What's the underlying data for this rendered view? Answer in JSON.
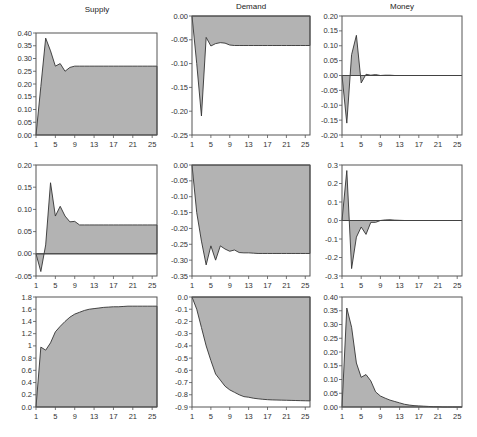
{
  "column_titles": [
    "Supply",
    "Demand",
    "Money"
  ],
  "chart_data": [
    {
      "type": "area",
      "panel": "row1-col1",
      "title": "Supply",
      "x": [
        1,
        2,
        3,
        4,
        5,
        6,
        7,
        8,
        9,
        10,
        11,
        12,
        13,
        14,
        15,
        16,
        17,
        18,
        19,
        20,
        21,
        22,
        23,
        24,
        25,
        26
      ],
      "values": [
        0.0,
        0.19,
        0.38,
        0.33,
        0.27,
        0.28,
        0.25,
        0.265,
        0.27,
        0.27,
        0.27,
        0.27,
        0.27,
        0.27,
        0.27,
        0.27,
        0.27,
        0.27,
        0.27,
        0.27,
        0.27,
        0.27,
        0.27,
        0.27,
        0.27,
        0.27
      ],
      "ylim": [
        0.0,
        0.4
      ],
      "yticks": [
        0.0,
        0.05,
        0.1,
        0.15,
        0.2,
        0.25,
        0.3,
        0.35,
        0.4
      ],
      "ytick_labels": [
        "0.00",
        "0.05",
        "0.10",
        "0.15",
        "0.20",
        "0.25",
        "0.30",
        "0.35",
        "0.40"
      ],
      "xticks": [
        1,
        5,
        9,
        13,
        17,
        21,
        25
      ],
      "xtick_labels": [
        "1",
        "5",
        "9",
        "13",
        "17",
        "21",
        "25"
      ]
    },
    {
      "type": "area",
      "panel": "row1-col2",
      "title": "Demand",
      "x": [
        1,
        2,
        3,
        4,
        5,
        6,
        7,
        8,
        9,
        10,
        11,
        12,
        13,
        14,
        15,
        16,
        17,
        18,
        19,
        20,
        21,
        22,
        23,
        24,
        25,
        26
      ],
      "values": [
        0.0,
        -0.1,
        -0.21,
        -0.045,
        -0.063,
        -0.058,
        -0.056,
        -0.057,
        -0.061,
        -0.062,
        -0.062,
        -0.062,
        -0.062,
        -0.062,
        -0.062,
        -0.062,
        -0.062,
        -0.062,
        -0.062,
        -0.062,
        -0.062,
        -0.062,
        -0.062,
        -0.062,
        -0.062,
        -0.062
      ],
      "ylim": [
        -0.25,
        0.0
      ],
      "yticks": [
        -0.25,
        -0.2,
        -0.15,
        -0.1,
        -0.05,
        0.0
      ],
      "ytick_labels": [
        "-0.25",
        "-0.20",
        "-0.15",
        "-0.10",
        "-0.05",
        "0.00"
      ],
      "xticks": [
        1,
        5,
        9,
        13,
        17,
        21,
        25
      ],
      "xtick_labels": [
        "1",
        "5",
        "9",
        "13",
        "17",
        "21",
        "25"
      ]
    },
    {
      "type": "area",
      "panel": "row1-col3",
      "title": "Money",
      "x": [
        1,
        2,
        3,
        4,
        5,
        6,
        7,
        8,
        9,
        10,
        11,
        12,
        13,
        14,
        15,
        16,
        17,
        18,
        19,
        20,
        21,
        22,
        23,
        24,
        25,
        26
      ],
      "values": [
        0.0,
        -0.16,
        0.07,
        0.135,
        -0.025,
        0.004,
        0.001,
        0.003,
        0.0,
        0.001,
        0.001,
        0.0,
        0.0,
        0.0,
        0.0,
        0.0,
        0.0,
        0.0,
        0.0,
        0.0,
        0.0,
        0.0,
        0.0,
        0.0,
        0.0,
        0.0
      ],
      "ylim": [
        -0.2,
        0.2
      ],
      "yticks": [
        -0.2,
        -0.15,
        -0.1,
        -0.05,
        0.0,
        0.05,
        0.1,
        0.15,
        0.2
      ],
      "ytick_labels": [
        "-0.20",
        "-0.15",
        "-0.10",
        "-0.05",
        "0.00",
        "0.05",
        "0.10",
        "0.15",
        "0.20"
      ],
      "xticks": [
        1,
        5,
        9,
        13,
        17,
        21,
        25
      ],
      "xtick_labels": [
        "1",
        "5",
        "9",
        "13",
        "17",
        "21",
        "25"
      ]
    },
    {
      "type": "area",
      "panel": "row2-col1",
      "title": "",
      "x": [
        1,
        2,
        3,
        4,
        5,
        6,
        7,
        8,
        9,
        10,
        11,
        12,
        13,
        14,
        15,
        16,
        17,
        18,
        19,
        20,
        21,
        22,
        23,
        24,
        25,
        26
      ],
      "values": [
        0.0,
        -0.04,
        0.02,
        0.16,
        0.085,
        0.107,
        0.085,
        0.072,
        0.073,
        0.065,
        0.065,
        0.065,
        0.065,
        0.065,
        0.065,
        0.065,
        0.065,
        0.065,
        0.065,
        0.065,
        0.065,
        0.065,
        0.065,
        0.065,
        0.065,
        0.065
      ],
      "ylim": [
        -0.05,
        0.2
      ],
      "yticks": [
        -0.05,
        0.0,
        0.05,
        0.1,
        0.15,
        0.2
      ],
      "ytick_labels": [
        "-0.05",
        "0.00",
        "0.05",
        "0.10",
        "0.15",
        "0.20"
      ],
      "xticks": [
        1,
        5,
        9,
        13,
        17,
        21,
        25
      ],
      "xtick_labels": [
        "1",
        "5",
        "9",
        "13",
        "17",
        "21",
        "25"
      ]
    },
    {
      "type": "area",
      "panel": "row2-col2",
      "title": "",
      "x": [
        1,
        2,
        3,
        4,
        5,
        6,
        7,
        8,
        9,
        10,
        11,
        12,
        13,
        14,
        15,
        16,
        17,
        18,
        19,
        20,
        21,
        22,
        23,
        24,
        25,
        26
      ],
      "values": [
        0.0,
        -0.15,
        -0.24,
        -0.315,
        -0.255,
        -0.3,
        -0.255,
        -0.265,
        -0.272,
        -0.268,
        -0.276,
        -0.277,
        -0.277,
        -0.278,
        -0.279,
        -0.279,
        -0.279,
        -0.279,
        -0.279,
        -0.279,
        -0.279,
        -0.279,
        -0.279,
        -0.279,
        -0.279,
        -0.279
      ],
      "ylim": [
        -0.35,
        0.0
      ],
      "yticks": [
        -0.35,
        -0.3,
        -0.25,
        -0.2,
        -0.15,
        -0.1,
        -0.05,
        0.0
      ],
      "ytick_labels": [
        "-0.35",
        "-0.30",
        "-0.25",
        "-0.20",
        "-0.15",
        "-0.10",
        "-0.05",
        "0.00"
      ],
      "xticks": [
        1,
        5,
        9,
        13,
        17,
        21,
        25
      ],
      "xtick_labels": [
        "1",
        "5",
        "9",
        "13",
        "17",
        "21",
        "25"
      ]
    },
    {
      "type": "area",
      "panel": "row2-col3",
      "title": "",
      "x": [
        1,
        2,
        3,
        4,
        5,
        6,
        7,
        8,
        9,
        10,
        11,
        12,
        13,
        14,
        15,
        16,
        17,
        18,
        19,
        20,
        21,
        22,
        23,
        24,
        25,
        26
      ],
      "values": [
        0.0,
        0.27,
        -0.26,
        -0.09,
        -0.035,
        -0.075,
        -0.01,
        -0.01,
        0.0,
        0.003,
        0.004,
        0.002,
        0.001,
        0.0,
        0.0,
        0.0,
        0.0,
        0.0,
        0.0,
        0.0,
        0.0,
        0.0,
        0.0,
        0.0,
        0.0,
        0.0
      ],
      "ylim": [
        -0.3,
        0.3
      ],
      "yticks": [
        -0.3,
        -0.2,
        -0.1,
        0.0,
        0.1,
        0.2,
        0.3
      ],
      "ytick_labels": [
        "-0.3",
        "-0.2",
        "-0.1",
        "0.0",
        "0.1",
        "0.2",
        "0.3"
      ],
      "xticks": [
        1,
        5,
        9,
        13,
        17,
        21,
        25
      ],
      "xtick_labels": [
        "1",
        "5",
        "9",
        "13",
        "17",
        "21",
        "25"
      ]
    },
    {
      "type": "area",
      "panel": "row3-col1",
      "title": "",
      "x": [
        1,
        2,
        3,
        4,
        5,
        6,
        7,
        8,
        9,
        10,
        11,
        12,
        13,
        14,
        15,
        16,
        17,
        18,
        19,
        20,
        21,
        22,
        23,
        24,
        25,
        26
      ],
      "values": [
        0.0,
        0.98,
        0.93,
        1.05,
        1.23,
        1.32,
        1.4,
        1.47,
        1.52,
        1.55,
        1.58,
        1.6,
        1.61,
        1.62,
        1.63,
        1.635,
        1.64,
        1.64,
        1.645,
        1.65,
        1.65,
        1.65,
        1.65,
        1.65,
        1.65,
        1.65
      ],
      "ylim": [
        0.0,
        1.8
      ],
      "yticks": [
        0.0,
        0.2,
        0.4,
        0.6,
        0.8,
        1.0,
        1.2,
        1.4,
        1.6,
        1.8
      ],
      "ytick_labels": [
        "0.0",
        "0.2",
        "0.4",
        "0.6",
        "0.8",
        "1",
        "1.2",
        "1.4",
        "1.6",
        "1.8"
      ],
      "xticks": [
        1,
        5,
        9,
        13,
        17,
        21,
        25
      ],
      "xtick_labels": [
        "1",
        "5",
        "9",
        "13",
        "17",
        "21",
        "25"
      ]
    },
    {
      "type": "area",
      "panel": "row3-col2",
      "title": "",
      "x": [
        1,
        2,
        3,
        4,
        5,
        6,
        7,
        8,
        9,
        10,
        11,
        12,
        13,
        14,
        15,
        16,
        17,
        18,
        19,
        20,
        21,
        22,
        23,
        24,
        25,
        26
      ],
      "values": [
        0.0,
        -0.1,
        -0.25,
        -0.4,
        -0.52,
        -0.63,
        -0.68,
        -0.73,
        -0.76,
        -0.78,
        -0.8,
        -0.815,
        -0.82,
        -0.828,
        -0.833,
        -0.837,
        -0.84,
        -0.842,
        -0.843,
        -0.844,
        -0.845,
        -0.846,
        -0.847,
        -0.848,
        -0.849,
        -0.85
      ],
      "ylim": [
        -0.9,
        0.0
      ],
      "yticks": [
        -0.9,
        -0.8,
        -0.7,
        -0.6,
        -0.5,
        -0.4,
        -0.3,
        -0.2,
        -0.1,
        0.0
      ],
      "ytick_labels": [
        "-0.9",
        "-0.8",
        "-0.7",
        "-0.6",
        "-0.5",
        "-0.4",
        "-0.3",
        "-0.2",
        "-0.1",
        "0.0"
      ],
      "xticks": [
        1,
        5,
        9,
        13,
        17,
        21,
        25
      ],
      "xtick_labels": [
        "1",
        "5",
        "9",
        "13",
        "17",
        "21",
        "25"
      ]
    },
    {
      "type": "area",
      "panel": "row3-col3",
      "title": "",
      "x": [
        1,
        2,
        3,
        4,
        5,
        6,
        7,
        8,
        9,
        10,
        11,
        12,
        13,
        14,
        15,
        16,
        17,
        18,
        19,
        20,
        21,
        22,
        23,
        24,
        25,
        26
      ],
      "values": [
        0.0,
        0.36,
        0.29,
        0.16,
        0.108,
        0.118,
        0.095,
        0.055,
        0.04,
        0.032,
        0.025,
        0.02,
        0.015,
        0.01,
        0.007,
        0.005,
        0.004,
        0.003,
        0.002,
        0.001,
        0.001,
        0.0,
        0.0,
        0.0,
        0.0,
        0.0
      ],
      "ylim": [
        0.0,
        0.4
      ],
      "yticks": [
        0.0,
        0.05,
        0.1,
        0.15,
        0.2,
        0.25,
        0.3,
        0.35,
        0.4
      ],
      "ytick_labels": [
        "0.00",
        "0.05",
        "0.10",
        "0.15",
        "0.20",
        "0.25",
        "0.30",
        "0.35",
        "0.40"
      ],
      "xticks": [
        1,
        5,
        9,
        13,
        17,
        21,
        25
      ],
      "xtick_labels": [
        "1",
        "5",
        "9",
        "13",
        "17",
        "21",
        "25"
      ]
    }
  ]
}
